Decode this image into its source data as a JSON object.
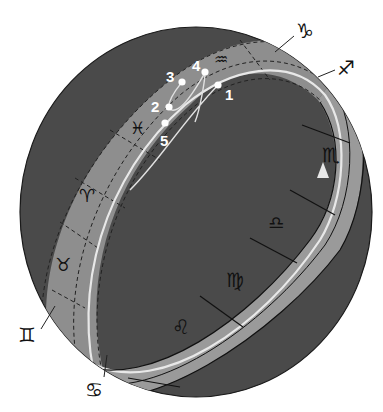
{
  "diagram": {
    "type": "celestial-sphere-zodiac-band",
    "colors": {
      "sphere": "#4a4a4a",
      "band": "#8e8e8e",
      "ecliptic_line": "#e8e8e8",
      "outline": "#1a1a1a",
      "background": "#ffffff"
    },
    "zodiac_signs": [
      {
        "name": "Capricorn",
        "glyph": "♑",
        "position": "outside-top-right"
      },
      {
        "name": "Sagittarius",
        "glyph": "♐",
        "position": "outside-right"
      },
      {
        "name": "Scorpio",
        "glyph": "♏",
        "position": "band-front-right"
      },
      {
        "name": "Libra",
        "glyph": "♎",
        "position": "band-front"
      },
      {
        "name": "Virgo",
        "glyph": "♍",
        "position": "band-front"
      },
      {
        "name": "Leo",
        "glyph": "♌",
        "position": "band-front-bottom"
      },
      {
        "name": "Cancer",
        "glyph": "♋",
        "position": "outside-bottom"
      },
      {
        "name": "Gemini",
        "glyph": "♊",
        "position": "outside-left"
      },
      {
        "name": "Taurus",
        "glyph": "♉",
        "position": "band-back-left"
      },
      {
        "name": "Aries",
        "glyph": "♈",
        "position": "band-back-left"
      },
      {
        "name": "Pisces",
        "glyph": "♓",
        "position": "band-back"
      },
      {
        "name": "Aquarius",
        "glyph": "♒",
        "position": "band-back-top"
      }
    ],
    "path_points": [
      {
        "label": "1"
      },
      {
        "label": "2"
      },
      {
        "label": "3"
      },
      {
        "label": "4"
      },
      {
        "label": "5"
      }
    ],
    "direction_arrow": "upward-along-ecliptic"
  }
}
